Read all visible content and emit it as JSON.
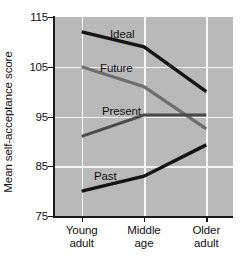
{
  "chart_data": {
    "type": "line",
    "title": "",
    "xlabel": "",
    "ylabel": "Mean self-acceptance score",
    "categories": [
      "Young adult",
      "Middle age",
      "Older adult"
    ],
    "category_lines": [
      [
        "Young",
        "adult"
      ],
      [
        "Middle",
        "age"
      ],
      [
        "Older",
        "adult"
      ]
    ],
    "ylim": [
      75,
      115
    ],
    "yticks": [
      115,
      105,
      95,
      85,
      75
    ],
    "ytick_labels": [
      "115",
      "105",
      "95",
      "85",
      "75"
    ],
    "grid": true,
    "legend": "inline-labels",
    "plot_background": "#b9b9b9",
    "gridline_color": "#f2f2f2",
    "series": [
      {
        "name": "Ideal",
        "values": [
          112.0,
          109.0,
          100.0
        ],
        "color": "#151515",
        "width": 3.4,
        "label_x": 110,
        "label_y": 28
      },
      {
        "name": "Future",
        "values": [
          105.0,
          101.0,
          92.5
        ],
        "color": "#6e6e6e",
        "width": 3.2,
        "label_x": 100,
        "label_y": 62
      },
      {
        "name": "Present",
        "values": [
          91.0,
          95.3,
          95.3
        ],
        "color": "#4a4a4a",
        "width": 3.0,
        "label_x": 102,
        "label_y": 105
      },
      {
        "name": "Past",
        "values": [
          80.0,
          83.0,
          89.3
        ],
        "color": "#151515",
        "width": 3.4,
        "label_x": 94,
        "label_y": 170
      }
    ]
  }
}
